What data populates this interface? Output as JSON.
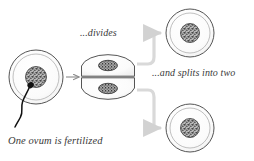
{
  "diagram": {
    "background_color": "#ffffff",
    "captions": {
      "fertilized": "One ovum is fertilized",
      "divides": "...divides",
      "splits": "...and splits into two"
    },
    "colors": {
      "cell_outline": "#555555",
      "cell_fill": "#fbfbfb",
      "inner_ring": "#9a9a9a",
      "nucleus_dark": "#3c3c3c",
      "nucleus_mid": "#8d8d8d",
      "nucleus_light": "#cfcfcf",
      "sperm": "#111111",
      "arrow_dark": "#8a8a8a",
      "arrow_light": "#d2d2d2",
      "caption_text": "#3a3a3a"
    },
    "stages": [
      {
        "id": "fertilized-ovum",
        "label": "One ovum is fertilized",
        "shape": "circle",
        "cx": 36,
        "cy": 77,
        "r": 27,
        "inner_ring_r": 23,
        "nucleus_r": 10.5,
        "has_sperm": true
      },
      {
        "id": "dividing-cell",
        "label": "...divides",
        "shape": "two-lobes",
        "cx": 108,
        "cy": 77,
        "lobe_rx": 27,
        "lobe_ry": 12.5,
        "upper_lobe_cy": 64,
        "lower_lobe_cy": 90,
        "nucleus_rx": 9,
        "nucleus_ry": 5
      },
      {
        "id": "daughter-cell-top",
        "label": "...and splits into two",
        "shape": "circle",
        "cx": 190,
        "cy": 33,
        "r": 24,
        "inner_ring_r": 20,
        "nucleus_r": 9.5,
        "has_sperm": false
      },
      {
        "id": "daughter-cell-bottom",
        "label": "...and splits into two",
        "shape": "circle",
        "cx": 190,
        "cy": 128,
        "r": 24,
        "inner_ring_r": 20,
        "nucleus_r": 9.5,
        "has_sperm": false
      }
    ],
    "arrows": [
      {
        "id": "arrow-ovum-to-dividing",
        "from": "fertilized-ovum",
        "to": "dividing-cell",
        "style": "straight",
        "color": "#8a8a8a"
      },
      {
        "id": "arrow-dividing-to-top",
        "from": "dividing-cell",
        "to": "daughter-cell-top",
        "style": "elbow-up",
        "color": "#d2d2d2"
      },
      {
        "id": "arrow-dividing-to-bottom",
        "from": "dividing-cell",
        "to": "daughter-cell-bottom",
        "style": "elbow-down",
        "color": "#d2d2d2"
      }
    ],
    "sperm": {
      "id": "sperm-cell",
      "head_cx": 30.5,
      "head_cy": 85,
      "head_r": 3.2,
      "tail_path": "M 29.5 87.5 C 27 94, 24 97, 22 103 C 20 109, 23 113, 20 118 C 18 122, 16 124, 15 127"
    }
  }
}
